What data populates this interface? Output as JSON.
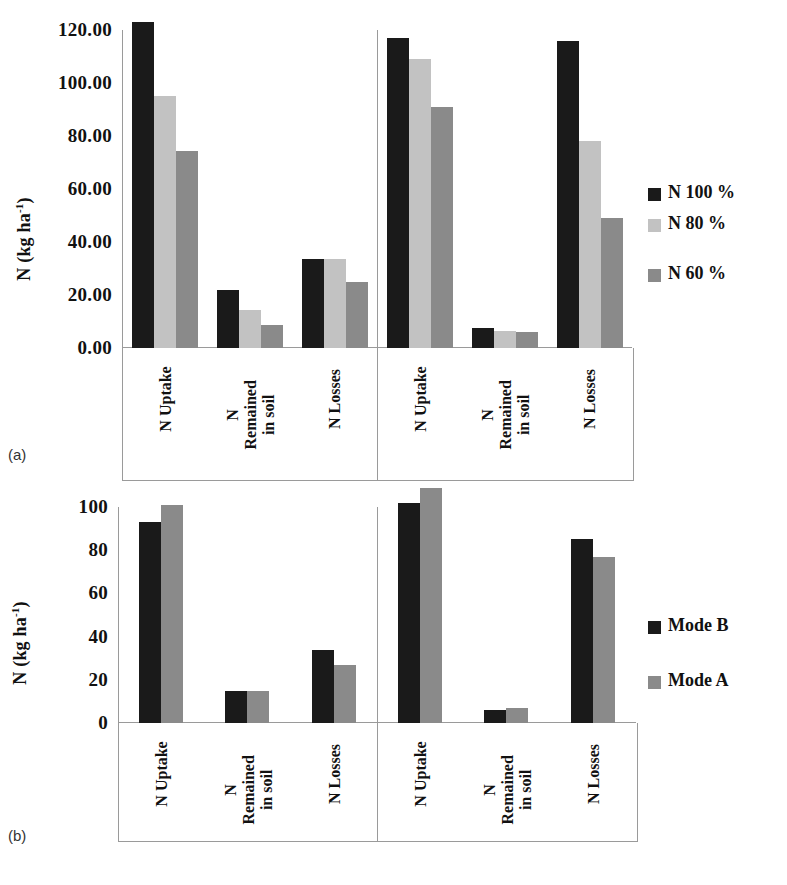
{
  "figure": {
    "panel_a_tag": "(a)",
    "panel_b_tag": "(b)",
    "axis_title_main": "N (kg ha",
    "axis_title_sup": "-1",
    "axis_title_close": ")"
  },
  "chart_data": [
    {
      "type": "bar",
      "panel": "(a)",
      "title": "",
      "xlabel": "",
      "ylabel": "N (kg ha-1)",
      "ylim": [
        0,
        120
      ],
      "yticks": [
        0,
        20,
        40,
        60,
        80,
        100,
        120
      ],
      "ytick_labels": [
        "0.00",
        "20.00",
        "40.00",
        "60.00",
        "80.00",
        "100.00",
        "120.00"
      ],
      "grid": false,
      "legend_position": "right",
      "groups": [
        "left",
        "right"
      ],
      "categories": [
        "N Uptake",
        "N\nRemained\nin soil",
        "N Losses"
      ],
      "series": [
        {
          "name": "N 100 %",
          "color": "#1a1a1a",
          "values_left": [
            123.0,
            22.0,
            33.5
          ],
          "values_right": [
            117.0,
            7.5,
            116.0
          ]
        },
        {
          "name": "N 80 %",
          "color": "#c2c2c2",
          "values_left": [
            95.0,
            14.5,
            33.5
          ],
          "values_right": [
            109.0,
            6.5,
            78.0
          ]
        },
        {
          "name": "N 60 %",
          "color": "#8a8a8a",
          "values_left": [
            74.5,
            8.5,
            25.0
          ],
          "values_right": [
            91.0,
            6.0,
            49.0
          ]
        }
      ]
    },
    {
      "type": "bar",
      "panel": "(b)",
      "title": "",
      "xlabel": "",
      "ylabel": "N (kg ha-1)",
      "ylim": [
        0,
        100
      ],
      "yticks": [
        0,
        20,
        40,
        60,
        80,
        100
      ],
      "ytick_labels": [
        "0",
        "20",
        "40",
        "60",
        "80",
        "100"
      ],
      "grid": false,
      "legend_position": "right",
      "groups": [
        "left",
        "right"
      ],
      "categories": [
        "N Uptake",
        "N\nRemained\nin soil",
        "N Losses"
      ],
      "series": [
        {
          "name": "Mode B",
          "color": "#1a1a1a",
          "values_left": [
            93.0,
            15.0,
            34.0
          ],
          "values_right": [
            102.0,
            6.0,
            85.0
          ]
        },
        {
          "name": "Mode A",
          "color": "#8a8a8a",
          "values_left": [
            101.0,
            15.0,
            27.0
          ],
          "values_right": [
            109.0,
            7.0,
            77.0
          ]
        }
      ]
    }
  ]
}
